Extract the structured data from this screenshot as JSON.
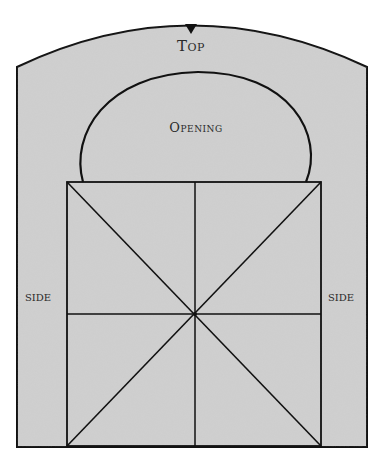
{
  "diagram": {
    "labels": {
      "top": "Top",
      "opening": "Opening",
      "side_left": "SIDE",
      "side_right": "SIDE"
    },
    "colors": {
      "panel_fill": "#cfcfcf",
      "stroke": "#111111",
      "background": "#ffffff"
    }
  }
}
